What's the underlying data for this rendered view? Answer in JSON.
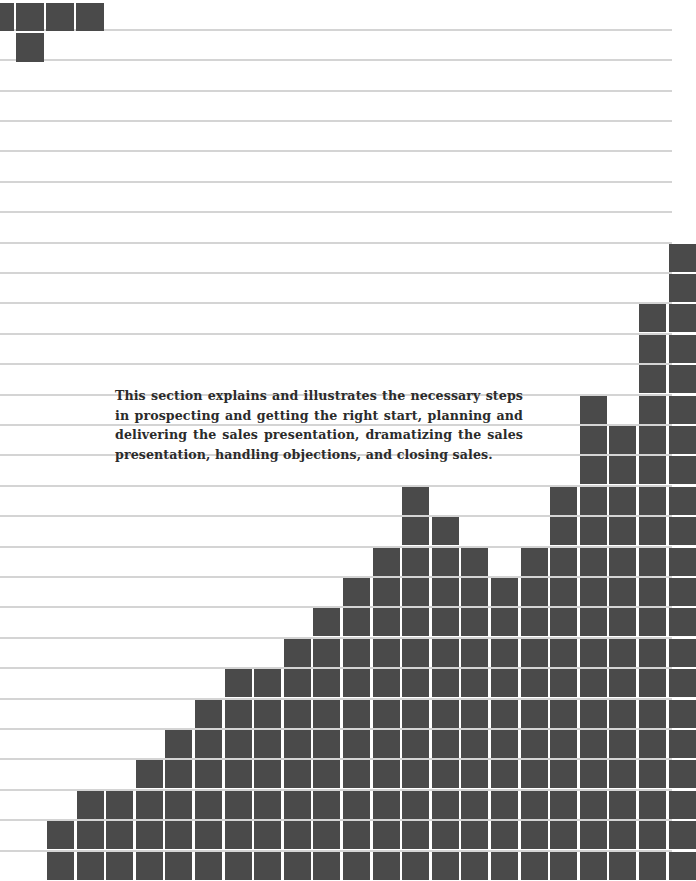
{
  "page": {
    "background": "#ffffff",
    "rule_color": "#d4d4d4",
    "block_color": "#4a4a4a",
    "text_color": "#2b2b2b"
  },
  "intro": {
    "text": "This section explains and illustrates the necessary steps in prospecting and getting the right start, planning and delivering the sales presentation, dramatizing the sales presentation, handling objections, and closing sales."
  },
  "grid": {
    "row_height": 30.4,
    "col_width": 29.6,
    "col_origin_x": 47,
    "rows_total": 29
  },
  "top_left_blocks": [
    {
      "x": 0,
      "y": 3,
      "w": 14,
      "h": 28
    },
    {
      "x": 16,
      "y": 3,
      "w": 28,
      "h": 28
    },
    {
      "x": 46,
      "y": 3,
      "w": 28,
      "h": 28
    },
    {
      "x": 76,
      "y": 3,
      "w": 28,
      "h": 28
    },
    {
      "x": 16,
      "y": 33,
      "w": 28,
      "h": 29
    }
  ],
  "chart_data": {
    "type": "bar",
    "title": "",
    "xlabel": "",
    "ylabel": "",
    "grid": true,
    "legend": "none",
    "categories": [
      "1",
      "2",
      "3",
      "4",
      "5",
      "6",
      "7",
      "8",
      "9",
      "10",
      "11",
      "12",
      "13",
      "14",
      "15",
      "16",
      "17",
      "18",
      "19",
      "20",
      "21",
      "22"
    ],
    "values": [
      2,
      3,
      3,
      4,
      5,
      6,
      7,
      7,
      8,
      9,
      10,
      11,
      13,
      12,
      11,
      10,
      11,
      13,
      16,
      15,
      19,
      21
    ],
    "ylim": [
      0,
      29
    ],
    "unit": "grid rows (decorative pictogram of rising sales)"
  }
}
